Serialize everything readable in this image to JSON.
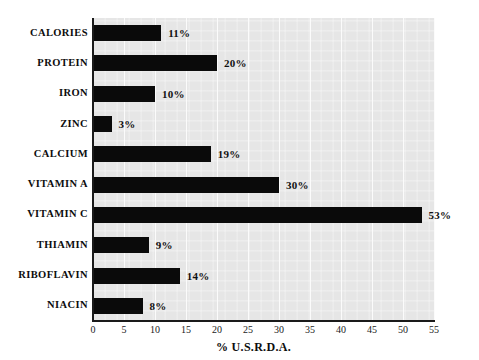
{
  "chart_data": {
    "type": "bar",
    "orientation": "horizontal",
    "title": "",
    "subtitle": "",
    "xlabel": "% U.S.R.D.A.",
    "ylabel": "",
    "categories": [
      "CALORIES",
      "PROTEIN",
      "IRON",
      "ZINC",
      "CALCIUM",
      "VITAMIN A",
      "VITAMIN C",
      "THIAMIN",
      "RIBOFLAVIN",
      "NIACIN"
    ],
    "values": [
      11,
      20,
      10,
      3,
      19,
      30,
      53,
      9,
      14,
      8
    ],
    "value_labels": [
      "11%",
      "20%",
      "10%",
      "3%",
      "19%",
      "30%",
      "53%",
      "9%",
      "14%",
      "8%"
    ],
    "xlim": [
      0,
      55
    ],
    "xticks": [
      0,
      5,
      10,
      15,
      20,
      25,
      30,
      35,
      40,
      45,
      50,
      55
    ],
    "xtick_labels": [
      "0",
      "5",
      "10",
      "15",
      "20",
      "25",
      "30",
      "35",
      "40",
      "45",
      "50",
      "55"
    ],
    "grid": true,
    "grid_axis": "x",
    "legend": false,
    "bar_color": "#0a0a0a",
    "plot_background": "#e6e6e6",
    "figure_background": "#ffffff",
    "axis_color": "#1a1a1a"
  }
}
